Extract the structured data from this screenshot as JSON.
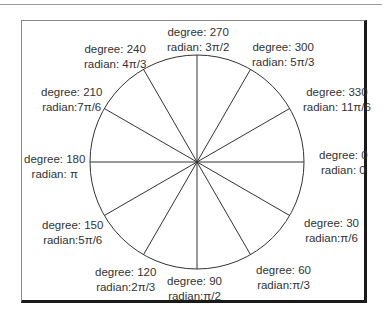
{
  "diagram": {
    "type": "unit-circle-angle-diagram",
    "center": {
      "x": 197,
      "y": 162
    },
    "radius": 107,
    "line_color": "#333333",
    "angles": [
      {
        "degree": 0,
        "degree_label": "degree: 0",
        "radian_label": "radian: 0"
      },
      {
        "degree": 30,
        "degree_label": "degree: 30",
        "radian_label": "radian:π/6"
      },
      {
        "degree": 60,
        "degree_label": "degree: 60",
        "radian_label": "radian:π/3"
      },
      {
        "degree": 90,
        "degree_label": "degree: 90",
        "radian_label": "radian:π/2"
      },
      {
        "degree": 120,
        "degree_label": "degree: 120",
        "radian_label": "radian:2π/3"
      },
      {
        "degree": 150,
        "degree_label": "degree: 150",
        "radian_label": "radian:5π/6"
      },
      {
        "degree": 180,
        "degree_label": "degree: 180",
        "radian_label": "radian: π"
      },
      {
        "degree": 210,
        "degree_label": "degree: 210",
        "radian_label": "radian:7π/6"
      },
      {
        "degree": 240,
        "degree_label": "degree: 240",
        "radian_label": "radian: 4π/3"
      },
      {
        "degree": 270,
        "degree_label": "degree: 270",
        "radian_label": "radian: 3π/2"
      },
      {
        "degree": 300,
        "degree_label": "degree: 300",
        "radian_label": "radian: 5π/3"
      },
      {
        "degree": 330,
        "degree_label": "degree: 330",
        "radian_label": "radian: 11π/6"
      }
    ]
  }
}
